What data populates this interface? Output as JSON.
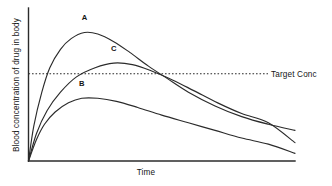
{
  "chart_data": {
    "type": "line",
    "title": "",
    "subtitle": "",
    "xlabel": "Time",
    "ylabel": "Blood concentration of drug in body",
    "xlim": [
      0,
      100
    ],
    "ylim": [
      0,
      100
    ],
    "grid": false,
    "axis_ticks": {
      "x": [],
      "y": []
    },
    "legend": {
      "position": "inline-annotation",
      "entries": [
        "A",
        "B",
        "C"
      ]
    },
    "annotations": [
      {
        "name": "target-concentration-line",
        "label": "Target Conc",
        "type": "horizontal-threshold",
        "y": 57
      }
    ],
    "series": [
      {
        "name": "A",
        "label": "A",
        "description": "Highest peak; rises steeply, peaks well above target concentration, then declines, crossing below curve C",
        "peak": {
          "x": 21,
          "y": 84
        },
        "label_point": {
          "x": 21,
          "y": 92
        },
        "points": [
          {
            "x": 0,
            "y": 0
          },
          {
            "x": 2,
            "y": 23
          },
          {
            "x": 5,
            "y": 45
          },
          {
            "x": 8,
            "y": 61
          },
          {
            "x": 12,
            "y": 73
          },
          {
            "x": 16,
            "y": 80
          },
          {
            "x": 21,
            "y": 84
          },
          {
            "x": 26,
            "y": 83
          },
          {
            "x": 32,
            "y": 78
          },
          {
            "x": 38,
            "y": 71
          },
          {
            "x": 45,
            "y": 62
          },
          {
            "x": 52,
            "y": 54
          },
          {
            "x": 60,
            "y": 45
          },
          {
            "x": 70,
            "y": 36
          },
          {
            "x": 80,
            "y": 29
          },
          {
            "x": 90,
            "y": 24
          },
          {
            "x": 100,
            "y": 20
          }
        ]
      },
      {
        "name": "C",
        "label": "C",
        "description": "Intermediate peak just above target concentration; slower decline than A, ends between A and B",
        "peak": {
          "x": 32,
          "y": 64
        },
        "label_point": {
          "x": 32,
          "y": 72
        },
        "points": [
          {
            "x": 0,
            "y": 0
          },
          {
            "x": 3,
            "y": 18
          },
          {
            "x": 7,
            "y": 33
          },
          {
            "x": 12,
            "y": 45
          },
          {
            "x": 18,
            "y": 55
          },
          {
            "x": 25,
            "y": 61
          },
          {
            "x": 32,
            "y": 64
          },
          {
            "x": 39,
            "y": 63
          },
          {
            "x": 46,
            "y": 59
          },
          {
            "x": 54,
            "y": 53
          },
          {
            "x": 62,
            "y": 46
          },
          {
            "x": 71,
            "y": 38
          },
          {
            "x": 80,
            "y": 31
          },
          {
            "x": 90,
            "y": 25
          },
          {
            "x": 100,
            "y": 12
          }
        ]
      },
      {
        "name": "B",
        "label": "B",
        "description": "Lowest peak, never reaches target concentration; shallow rise and slow decline",
        "peak": {
          "x": 20,
          "y": 41
        },
        "label_point": {
          "x": 20,
          "y": 49
        },
        "points": [
          {
            "x": 0,
            "y": 0
          },
          {
            "x": 3,
            "y": 14
          },
          {
            "x": 6,
            "y": 24
          },
          {
            "x": 10,
            "y": 32
          },
          {
            "x": 15,
            "y": 38
          },
          {
            "x": 20,
            "y": 41
          },
          {
            "x": 26,
            "y": 41
          },
          {
            "x": 33,
            "y": 39
          },
          {
            "x": 41,
            "y": 35
          },
          {
            "x": 50,
            "y": 30
          },
          {
            "x": 60,
            "y": 25
          },
          {
            "x": 70,
            "y": 20
          },
          {
            "x": 80,
            "y": 15
          },
          {
            "x": 90,
            "y": 11
          },
          {
            "x": 100,
            "y": 5
          }
        ]
      }
    ],
    "colors": {
      "curve": "#2b2b2b",
      "axis": "#2b2b2b",
      "target": "#2b2b2b",
      "background": "#ffffff"
    }
  }
}
